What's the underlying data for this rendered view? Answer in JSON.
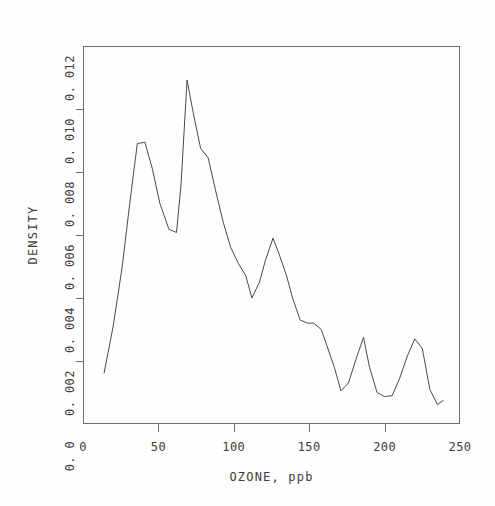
{
  "chart_data": {
    "type": "line",
    "title": "",
    "xlabel": "OZONE, ppb",
    "ylabel": "DENSITY",
    "xlim": [
      0,
      250
    ],
    "ylim": [
      0.0,
      0.012
    ],
    "xticks": [
      0,
      50,
      100,
      150,
      200,
      250
    ],
    "xtick_labels": [
      "0",
      "50",
      "100",
      "150",
      "200",
      "250"
    ],
    "yticks": [
      0.0,
      0.002,
      0.004,
      0.006,
      0.008,
      0.01,
      0.012
    ],
    "ytick_labels": [
      "0. 0",
      "0. 002",
      "0. 004",
      "0. 006",
      "0. 008",
      "0. 010",
      "0. 012"
    ],
    "grid": false,
    "legend": null,
    "line_color": "#4a4a4a",
    "frame_color": "#6e6e6e",
    "background": "#ffffff",
    "series": [
      {
        "name": "density",
        "x": [
          14,
          20,
          26,
          31,
          36,
          41,
          46,
          51,
          57,
          62,
          65,
          69,
          73,
          78,
          83,
          88,
          93,
          98,
          103,
          108,
          112,
          117,
          121,
          126,
          130,
          135,
          139,
          144,
          149,
          153,
          158,
          162,
          167,
          171,
          176,
          181,
          186,
          190,
          195,
          200,
          205,
          210,
          215,
          220,
          225,
          230,
          235,
          239
        ],
        "y": [
          0.00162,
          0.0031,
          0.005,
          0.007,
          0.0089,
          0.00895,
          0.0081,
          0.007,
          0.00618,
          0.00608,
          0.0076,
          0.01092,
          0.0099,
          0.00875,
          0.00845,
          0.0074,
          0.0064,
          0.0056,
          0.0051,
          0.0047,
          0.004,
          0.0045,
          0.0052,
          0.0059,
          0.0054,
          0.0047,
          0.004,
          0.0033,
          0.0032,
          0.0032,
          0.003,
          0.00245,
          0.00175,
          0.00105,
          0.0013,
          0.00205,
          0.00275,
          0.0018,
          0.001,
          0.00087,
          0.0009,
          0.00145,
          0.00215,
          0.0027,
          0.0024,
          0.0011,
          0.00062,
          0.00075
        ]
      }
    ]
  },
  "axes": {
    "y_title": "DENSITY",
    "x_title": "OZONE, ppb"
  }
}
